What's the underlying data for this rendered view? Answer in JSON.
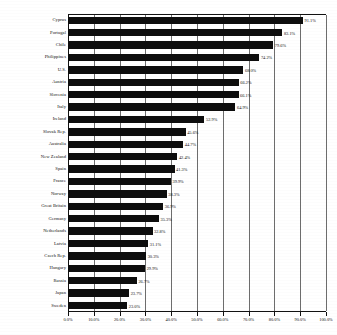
{
  "chart_data": {
    "type": "bar",
    "orientation": "horizontal",
    "title": "",
    "subtitle": "",
    "xlabel": "",
    "ylabel": "",
    "xlim": [
      0,
      100
    ],
    "grid": true,
    "legend": false,
    "legend_position": "none",
    "value_suffix": "%",
    "bar_color": "#0d0d0d",
    "categories": [
      "Cyprus",
      "Portugal",
      "Chile",
      "Philippines",
      "U.S.",
      "Austria",
      "Slovenia",
      "Italy",
      "Ireland",
      "Slovak Rep.",
      "Australia",
      "New Zealand",
      "Spain",
      "France",
      "Norway",
      "Great Britain",
      "Germany",
      "Netherlands",
      "Latvia",
      "Czech Rep.",
      "Hungary",
      "Russia",
      "Japan",
      "Sweden"
    ],
    "values": [
      91.1,
      83.1,
      79.6,
      74.2,
      68.0,
      66.2,
      66.1,
      64.9,
      52.9,
      45.6,
      44.7,
      42.4,
      41.3,
      39.9,
      38.3,
      36.9,
      35.3,
      32.8,
      31.1,
      30.3,
      29.9,
      26.7,
      23.7,
      23.0
    ],
    "value_labels": [
      "91.1%",
      "83.1%",
      "79.6%",
      "74.2%",
      "68.0%",
      "66.2%",
      "66.1%",
      "64.9%",
      "52.9%",
      "45.6%",
      "44.7%",
      "42.4%",
      "41.3%",
      "39.9%",
      "38.3%",
      "36.9%",
      "35.3%",
      "32.8%",
      "31.1%",
      "30.3%",
      "29.9%",
      "26.7%",
      "23.7%",
      "23.0%"
    ],
    "xticks": [
      0,
      10,
      20,
      30,
      40,
      50,
      60,
      70,
      80,
      90,
      100
    ],
    "xtick_labels": [
      "0.0%",
      "10.0%",
      "20.0%",
      "30.0%",
      "40.0%",
      "50.0%",
      "60.0%",
      "70.0%",
      "80.0%",
      "90.0%",
      "100.0%"
    ]
  }
}
